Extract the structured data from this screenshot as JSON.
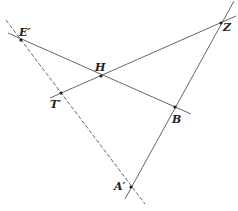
{
  "diagram": {
    "type": "geometric-construction",
    "points": [
      {
        "id": "E",
        "label": "E′",
        "x": 21,
        "y": 40,
        "label_x": 19,
        "label_y": 36
      },
      {
        "id": "H",
        "label": "H",
        "x": 101,
        "y": 76,
        "label_x": 95,
        "label_y": 71
      },
      {
        "id": "Z",
        "label": "Z",
        "x": 221,
        "y": 23,
        "label_x": 223,
        "label_y": 31
      },
      {
        "id": "T",
        "label": "T′",
        "x": 61,
        "y": 93,
        "label_x": 50,
        "label_y": 108
      },
      {
        "id": "B",
        "label": "B",
        "x": 175,
        "y": 107,
        "label_x": 172,
        "label_y": 123
      },
      {
        "id": "A",
        "label": "A′",
        "x": 131,
        "y": 187,
        "label_x": 114,
        "label_y": 190
      }
    ],
    "segments": [
      {
        "name": "line-E-H-B",
        "x1": 8,
        "y1": 33,
        "x2": 191,
        "y2": 114,
        "style": "solid"
      },
      {
        "name": "line-T-H-Z",
        "x1": 50,
        "y1": 98,
        "x2": 236,
        "y2": 16,
        "style": "solid"
      },
      {
        "name": "line-Z-B-A",
        "x1": 234,
        "y1": 1,
        "x2": 125,
        "y2": 199,
        "style": "solid"
      },
      {
        "name": "line-E-T-A-dashed",
        "x1": 6,
        "y1": 20,
        "x2": 145,
        "y2": 204,
        "style": "dashed"
      }
    ],
    "colors": {
      "line": "#555555",
      "point": "#222222",
      "label": "#222222"
    }
  }
}
